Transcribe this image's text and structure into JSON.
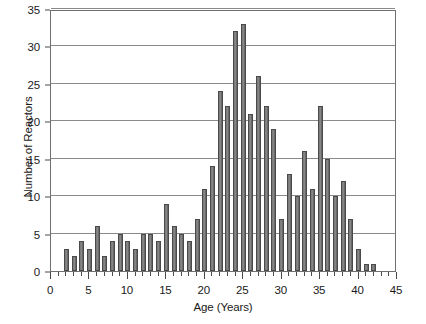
{
  "chart_data": {
    "type": "bar",
    "title": "",
    "xlabel": "Age (Years)",
    "ylabel": "Number of Reactors",
    "xlim": [
      0,
      45
    ],
    "ylim": [
      0,
      35
    ],
    "grid": true,
    "legend": null,
    "x_tick_labels": [
      "0",
      "5",
      "10",
      "15",
      "20",
      "25",
      "30",
      "35",
      "40",
      "45"
    ],
    "x_tick_values": [
      0,
      5,
      10,
      15,
      20,
      25,
      30,
      35,
      40,
      45
    ],
    "x_minor_tick_step": 1,
    "y_tick_labels": [
      "0",
      "5",
      "10",
      "15",
      "20",
      "25",
      "30",
      "35"
    ],
    "y_tick_values": [
      0,
      5,
      10,
      15,
      20,
      25,
      30,
      35
    ],
    "bar_color": "#7b7b7b",
    "bar_edge_color": "#4a4a4a",
    "grid_color": "#8a8a8a",
    "frame_color": "#6f6f6f",
    "categories": [
      2,
      3,
      4,
      5,
      6,
      7,
      8,
      9,
      10,
      11,
      12,
      13,
      14,
      15,
      16,
      17,
      18,
      19,
      20,
      21,
      22,
      23,
      24,
      25,
      26,
      27,
      28,
      29,
      30,
      31,
      32,
      33,
      34,
      35,
      36,
      37,
      38,
      39,
      40,
      41,
      42
    ],
    "values": [
      3,
      2,
      4,
      3,
      6,
      2,
      4,
      5,
      4,
      3,
      5,
      5,
      4,
      9,
      6,
      5,
      4,
      7,
      11,
      14,
      24,
      22,
      32,
      33,
      21,
      26,
      22,
      19,
      7,
      13,
      10,
      16,
      11,
      22,
      15,
      10,
      12,
      7,
      3,
      1,
      1
    ]
  }
}
